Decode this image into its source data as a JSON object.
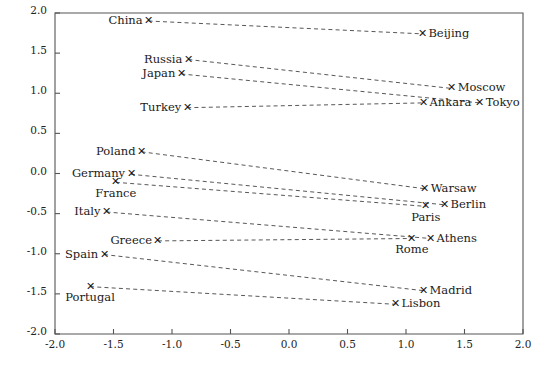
{
  "chart_data": {
    "type": "scatter",
    "title": "",
    "xlabel": "",
    "ylabel": "",
    "xlim": [
      -2.0,
      2.0
    ],
    "ylim": [
      -2.0,
      2.0
    ],
    "grid": false,
    "legend": "none",
    "xticks": [
      "-2.0",
      "-1.5",
      "-1.0",
      "-0.5",
      "0.0",
      "0.5",
      "1.0",
      "1.5",
      "2.0"
    ],
    "xtick_values": [
      -2.0,
      -1.5,
      -1.0,
      -0.5,
      0.0,
      0.5,
      1.0,
      1.5,
      2.0
    ],
    "yticks": [
      "-2.0",
      "-1.5",
      "-1.0",
      "-0.5",
      "0.0",
      "0.5",
      "1.0",
      "1.5",
      "2.0"
    ],
    "ytick_values": [
      -2.0,
      -1.5,
      -1.0,
      -0.5,
      0.0,
      0.5,
      1.0,
      1.5,
      2.0
    ],
    "marker_glyph": "✕",
    "pairs": [
      {
        "country": {
          "label": "China",
          "x": -1.2,
          "y": 1.9,
          "label_pos": "left"
        },
        "city": {
          "label": "Beijing",
          "x": 1.14,
          "y": 1.74,
          "label_pos": "right"
        }
      },
      {
        "country": {
          "label": "Russia",
          "x": -0.86,
          "y": 1.42,
          "label_pos": "left"
        },
        "city": {
          "label": "Moscow",
          "x": 1.39,
          "y": 1.06,
          "label_pos": "right"
        }
      },
      {
        "country": {
          "label": "Japan",
          "x": -0.92,
          "y": 1.24,
          "label_pos": "left"
        },
        "city": {
          "label": "Tokyo",
          "x": 1.63,
          "y": 0.88,
          "label_pos": "right"
        }
      },
      {
        "country": {
          "label": "Turkey",
          "x": -0.87,
          "y": 0.82,
          "label_pos": "left"
        },
        "city": {
          "label": "Ankara",
          "x": 1.15,
          "y": 0.88,
          "label_pos": "right"
        }
      },
      {
        "country": {
          "label": "Poland",
          "x": -1.26,
          "y": 0.27,
          "label_pos": "left"
        },
        "city": {
          "label": "Warsaw",
          "x": 1.16,
          "y": -0.19,
          "label_pos": "right"
        }
      },
      {
        "country": {
          "label": "Germany",
          "x": -1.35,
          "y": -0.01,
          "label_pos": "left"
        },
        "city": {
          "label": "Berlin",
          "x": 1.33,
          "y": -0.39,
          "label_pos": "right"
        }
      },
      {
        "country": {
          "label": "France",
          "x": -1.48,
          "y": -0.11,
          "label_pos": "below"
        },
        "city": {
          "label": "Paris",
          "x": 1.17,
          "y": -0.41,
          "label_pos": "below"
        }
      },
      {
        "country": {
          "label": "Italy",
          "x": -1.56,
          "y": -0.48,
          "label_pos": "left"
        },
        "city": {
          "label": "Athens",
          "x": 1.21,
          "y": -0.81,
          "label_pos": "right"
        }
      },
      {
        "country": {
          "label": "Greece",
          "x": -1.12,
          "y": -0.84,
          "label_pos": "left"
        },
        "city": {
          "label": "Rome",
          "x": 1.05,
          "y": -0.81,
          "label_pos": "below"
        }
      },
      {
        "country": {
          "label": "Spain",
          "x": -1.58,
          "y": -1.01,
          "label_pos": "left"
        },
        "city": {
          "label": "Madrid",
          "x": 1.15,
          "y": -1.46,
          "label_pos": "right"
        }
      },
      {
        "country": {
          "label": "Portugal",
          "x": -1.7,
          "y": -1.41,
          "label_pos": "below"
        },
        "city": {
          "label": "Lisbon",
          "x": 0.91,
          "y": -1.63,
          "label_pos": "right"
        }
      }
    ]
  },
  "plot": {
    "left_px": 55,
    "right_px": 523,
    "top_px": 13,
    "bottom_px": 334
  }
}
